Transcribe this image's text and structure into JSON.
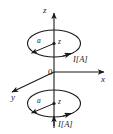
{
  "figure": {
    "kind": "3d-axes-coil-diagram",
    "width": 113,
    "height": 134,
    "background_color": "#ffffff",
    "stroke_color": "#1a1a1a",
    "axes": {
      "z_label": "z",
      "x_label": "x",
      "y_label": "y",
      "origin_label": "0"
    },
    "loops": [
      {
        "name": "upper-loop",
        "radius_label": "a",
        "height_label": "z",
        "current_label": "I[A]"
      },
      {
        "name": "lower-loop",
        "radius_label": "a",
        "height_label": "z",
        "current_label": "I[A]"
      }
    ]
  }
}
